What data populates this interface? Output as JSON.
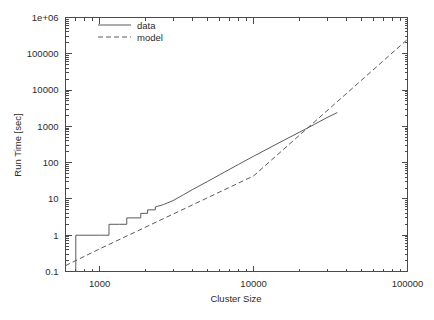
{
  "chart_data": {
    "type": "line",
    "title": "",
    "subtitle": "",
    "xlabel": "Cluster Size",
    "ylabel": "Run Time [sec]",
    "xscale": "log",
    "yscale": "log",
    "xlim": [
      600,
      100000
    ],
    "ylim": [
      0.1,
      1000000
    ],
    "grid": false,
    "legend_position": "top-left-inside",
    "x_tick_labels": [
      "1000",
      "10000",
      "100000"
    ],
    "x_tick_values": [
      1000,
      10000,
      100000
    ],
    "y_tick_labels": [
      "1e+06",
      "100000",
      "10000",
      "1000",
      "100",
      "10",
      "1",
      "0.1"
    ],
    "y_tick_values": [
      1000000,
      100000,
      10000,
      1000,
      100,
      10,
      1,
      0.1
    ],
    "series": [
      {
        "name": "data",
        "style": "solid",
        "color": "#5a5a5a",
        "points": [
          [
            700,
            0.1
          ],
          [
            700,
            1.0
          ],
          [
            1000,
            1.0
          ],
          [
            1000,
            1.0
          ],
          [
            1150,
            1.0
          ],
          [
            1150,
            2.0
          ],
          [
            1350,
            2.0
          ],
          [
            1350,
            2.0
          ],
          [
            1500,
            2.0
          ],
          [
            1500,
            3.0
          ],
          [
            1700,
            3.0
          ],
          [
            1700,
            3.0
          ],
          [
            1850,
            3.0
          ],
          [
            1850,
            4.0
          ],
          [
            2050,
            4.0
          ],
          [
            2050,
            5.0
          ],
          [
            2300,
            5.0
          ],
          [
            2300,
            6.0
          ],
          [
            2600,
            7.0
          ],
          [
            3000,
            9.0
          ],
          [
            3500,
            13.0
          ],
          [
            4000,
            18.0
          ],
          [
            5000,
            30.0
          ],
          [
            6000,
            46.0
          ],
          [
            8000,
            90.0
          ],
          [
            10000,
            150.0
          ],
          [
            13000,
            270.0
          ],
          [
            16000,
            430.0
          ],
          [
            20000,
            700.0
          ],
          [
            25000,
            1150.0
          ],
          [
            30000,
            1750.0
          ],
          [
            35000,
            2400.0
          ]
        ]
      },
      {
        "name": "model",
        "style": "dashed",
        "color": "#5a5a5a",
        "points": [
          [
            600,
            0.145
          ],
          [
            1000,
            0.42
          ],
          [
            10000,
            43.0
          ],
          [
            100000,
            250000.0
          ]
        ]
      }
    ],
    "annotations": []
  },
  "legend": {
    "entries": [
      {
        "label": "data"
      },
      {
        "label": "model"
      }
    ]
  },
  "axes": {
    "x_title": "Cluster Size",
    "y_title": "Run Time [sec]"
  }
}
